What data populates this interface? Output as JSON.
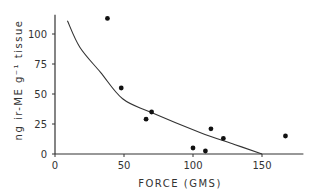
{
  "chart_data": {
    "type": "scatter",
    "title": "",
    "xlabel": "FORCE (GMS)",
    "ylabel": "ng ir-ME g⁻¹ tissue",
    "xlim": [
      0,
      180
    ],
    "ylim": [
      0,
      116
    ],
    "xticks": [
      0,
      50,
      100,
      150
    ],
    "yticks": [
      0,
      25,
      50,
      75,
      100
    ],
    "grid": false,
    "legend": null,
    "series": [
      {
        "name": "observations",
        "kind": "points",
        "points": [
          {
            "x": 38,
            "y": 113
          },
          {
            "x": 48,
            "y": 55
          },
          {
            "x": 66,
            "y": 29
          },
          {
            "x": 70,
            "y": 35
          },
          {
            "x": 100,
            "y": 5
          },
          {
            "x": 109,
            "y": 2.5
          },
          {
            "x": 113,
            "y": 21
          },
          {
            "x": 122,
            "y": 13
          },
          {
            "x": 167,
            "y": 15
          }
        ]
      },
      {
        "name": "fitted curve",
        "kind": "line",
        "points": [
          {
            "x": 9,
            "y": 111
          },
          {
            "x": 18,
            "y": 89
          },
          {
            "x": 33,
            "y": 68
          },
          {
            "x": 49,
            "y": 46
          },
          {
            "x": 69,
            "y": 35
          },
          {
            "x": 105,
            "y": 18
          },
          {
            "x": 130,
            "y": 8
          },
          {
            "x": 150,
            "y": 0
          }
        ]
      }
    ]
  }
}
